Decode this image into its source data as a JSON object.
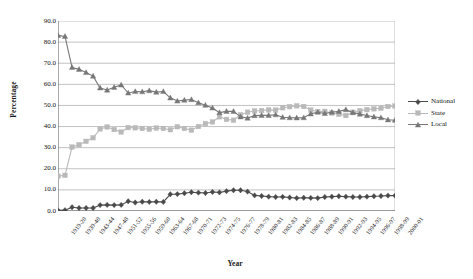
{
  "chart_data": {
    "type": "line",
    "title": "",
    "xlabel": "Year",
    "ylabel": "Percentage",
    "ylim": [
      0,
      90
    ],
    "yticks": [
      "0.0",
      "10.0",
      "20.0",
      "30.0",
      "40.0",
      "50.0",
      "60.0",
      "70.0",
      "80.0",
      "90.0"
    ],
    "grid": true,
    "legend_position": "right",
    "categories": [
      "1919-20",
      "1929-30",
      "1939-40",
      "1941-42",
      "1943-44",
      "1945-46",
      "1947-48",
      "1949-50",
      "1951-52",
      "1953-54",
      "1955-56",
      "1957-58",
      "1959-60",
      "1961-62",
      "1963-64",
      "1965-66",
      "1967-68",
      "1969-70",
      "1970-71",
      "1971-72",
      "1972-73",
      "1973-74",
      "1974-75",
      "1975-76",
      "1976-77",
      "1977-78",
      "1978-79",
      "1979-80",
      "1980-81",
      "1981-82",
      "1982-83",
      "1983-84",
      "1984-85",
      "1985-86",
      "1986-87",
      "1987-88",
      "1988-89",
      "1989-90",
      "1990-91",
      "1991-92",
      "1992-93",
      "1993-94",
      "1994-95",
      "1995-96",
      "1996-97",
      "1997-98",
      "1998-99",
      "1999-00",
      "2000-01"
    ],
    "xtick_labels": [
      "1919-20",
      "1939-40",
      "1943-44",
      "1947-48",
      "1951-52",
      "1955-56",
      "1959-60",
      "1963-64",
      "1967-68",
      "1970-71",
      "1972-73",
      "1974-75",
      "1976-77",
      "1978-79",
      "1980-81",
      "1982-83",
      "1984-85",
      "1986-87",
      "1988-89",
      "1990-91",
      "1992-93",
      "1994-95",
      "1996-97",
      "1998-99",
      "2000-01"
    ],
    "series": [
      {
        "name": "National",
        "color": "#4a4a4a",
        "marker": "diamond",
        "values": [
          0.3,
          0.4,
          1.8,
          1.4,
          1.4,
          1.4,
          2.8,
          2.9,
          2.8,
          2.9,
          4.6,
          4.0,
          4.4,
          4.3,
          4.4,
          4.3,
          7.9,
          8.0,
          8.4,
          8.9,
          8.7,
          8.5,
          9.0,
          8.8,
          9.4,
          9.8,
          9.8,
          9.2,
          7.4,
          7.1,
          6.8,
          6.6,
          6.7,
          6.4,
          6.1,
          6.3,
          6.2,
          6.1,
          6.6,
          6.8,
          7.0,
          6.8,
          6.6,
          6.6,
          6.8,
          7.0,
          7.1,
          7.3,
          7.3
        ]
      },
      {
        "name": "State",
        "color": "#b9b9b9",
        "marker": "square",
        "values": [
          16.5,
          16.9,
          30.3,
          31.4,
          33.0,
          34.7,
          38.9,
          39.8,
          38.6,
          37.4,
          39.5,
          39.4,
          39.1,
          38.7,
          39.3,
          39.1,
          38.5,
          39.9,
          39.1,
          38.3,
          40.0,
          41.4,
          42.2,
          44.6,
          43.4,
          43.0,
          45.6,
          46.8,
          47.4,
          47.6,
          47.9,
          47.8,
          48.9,
          49.4,
          49.8,
          49.5,
          47.8,
          47.1,
          47.2,
          46.4,
          45.8,
          45.2,
          46.8,
          47.5,
          48.0,
          48.4,
          48.7,
          49.5,
          49.7
        ]
      },
      {
        "name": "Local",
        "color": "#777777",
        "marker": "triangle",
        "values": [
          83.2,
          82.7,
          68.0,
          67.1,
          65.6,
          63.9,
          58.3,
          57.3,
          58.6,
          59.7,
          55.9,
          56.6,
          56.5,
          57.0,
          56.3,
          56.6,
          53.6,
          52.1,
          52.5,
          52.8,
          51.3,
          50.1,
          48.8,
          46.6,
          47.2,
          47.2,
          44.6,
          44.0,
          45.2,
          45.3,
          45.3,
          45.6,
          44.4,
          44.2,
          44.1,
          44.2,
          46.0,
          46.8,
          46.2,
          46.8,
          47.2,
          48.0,
          46.6,
          45.9,
          45.2,
          44.6,
          44.2,
          43.2,
          43.0
        ]
      }
    ]
  },
  "legend": {
    "items": [
      {
        "label": "National"
      },
      {
        "label": "State"
      },
      {
        "label": "Local"
      }
    ]
  },
  "axis": {
    "y_title": "Percentage",
    "x_title": "Year"
  }
}
